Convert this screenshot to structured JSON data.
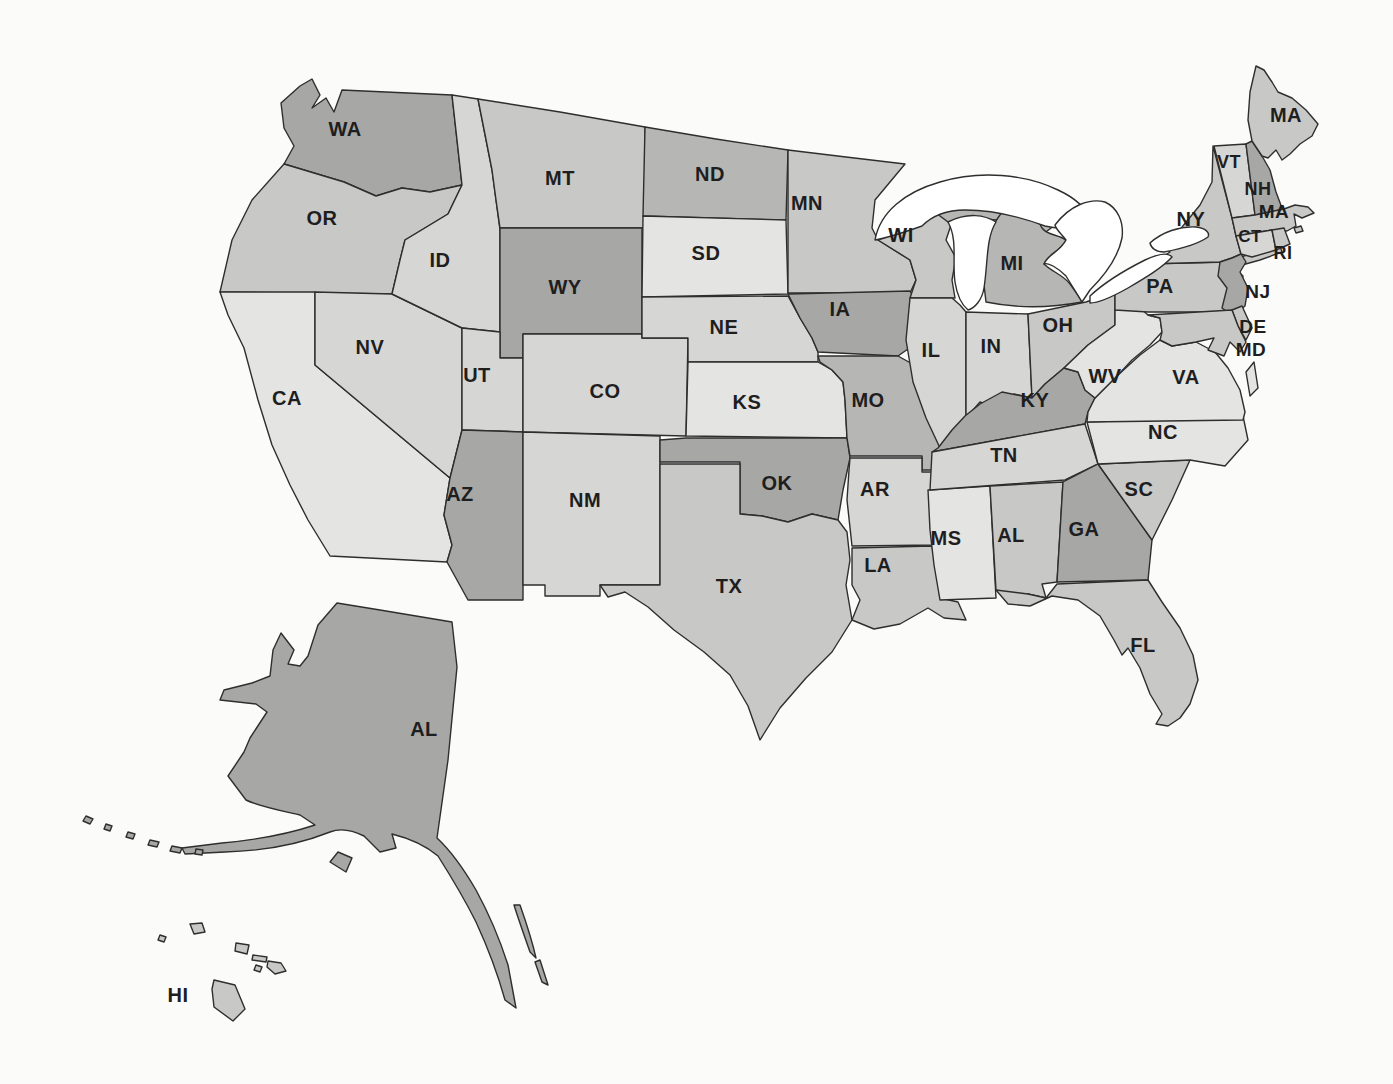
{
  "figure": {
    "kind": "us-states-map",
    "background": "#fbfbfa",
    "border_color": "#2e2e2e",
    "label_color": "#1e1e1e"
  },
  "palette": {
    "s1": "#e4e4e3",
    "s2": "#d6d6d5",
    "s3": "#c8c8c7",
    "s4": "#b6b6b5",
    "s5": "#a7a7a6",
    "water": "#ffffff"
  },
  "states": [
    {
      "id": "WA",
      "label": "WA",
      "shade": "s5"
    },
    {
      "id": "OR",
      "label": "OR",
      "shade": "s3"
    },
    {
      "id": "CA",
      "label": "CA",
      "shade": "s1"
    },
    {
      "id": "NV",
      "label": "NV",
      "shade": "s2"
    },
    {
      "id": "ID",
      "label": "ID",
      "shade": "s2"
    },
    {
      "id": "MT",
      "label": "MT",
      "shade": "s3"
    },
    {
      "id": "WY",
      "label": "WY",
      "shade": "s5"
    },
    {
      "id": "UT",
      "label": "UT",
      "shade": "s2"
    },
    {
      "id": "CO",
      "label": "CO",
      "shade": "s2"
    },
    {
      "id": "AZ",
      "label": "AZ",
      "shade": "s5"
    },
    {
      "id": "NM",
      "label": "NM",
      "shade": "s2"
    },
    {
      "id": "ND",
      "label": "ND",
      "shade": "s4"
    },
    {
      "id": "SD",
      "label": "SD",
      "shade": "s1"
    },
    {
      "id": "NE",
      "label": "NE",
      "shade": "s2"
    },
    {
      "id": "KS",
      "label": "KS",
      "shade": "s1"
    },
    {
      "id": "OK",
      "label": "OK",
      "shade": "s5"
    },
    {
      "id": "TX",
      "label": "TX",
      "shade": "s3"
    },
    {
      "id": "MN",
      "label": "MN",
      "shade": "s3"
    },
    {
      "id": "IA",
      "label": "IA",
      "shade": "s5"
    },
    {
      "id": "MO",
      "label": "MO",
      "shade": "s4"
    },
    {
      "id": "AR",
      "label": "AR",
      "shade": "s2"
    },
    {
      "id": "LA",
      "label": "LA",
      "shade": "s3"
    },
    {
      "id": "MS",
      "label": "MS",
      "shade": "s1"
    },
    {
      "id": "WI",
      "label": "WI",
      "shade": "s3"
    },
    {
      "id": "IL",
      "label": "IL",
      "shade": "s2"
    },
    {
      "id": "IN",
      "label": "IN",
      "shade": "s2"
    },
    {
      "id": "OH",
      "label": "OH",
      "shade": "s3"
    },
    {
      "id": "MI",
      "label": "MI",
      "shade": "s4"
    },
    {
      "id": "KY",
      "label": "KY",
      "shade": "s5"
    },
    {
      "id": "TN",
      "label": "TN",
      "shade": "s2"
    },
    {
      "id": "AL",
      "label": "AL",
      "shade": "s3"
    },
    {
      "id": "GA",
      "label": "GA",
      "shade": "s5"
    },
    {
      "id": "FL",
      "label": "FL",
      "shade": "s3"
    },
    {
      "id": "SC",
      "label": "SC",
      "shade": "s3"
    },
    {
      "id": "NC",
      "label": "NC",
      "shade": "s1"
    },
    {
      "id": "VA",
      "label": "VA",
      "shade": "s1"
    },
    {
      "id": "WV",
      "label": "WV",
      "shade": "s1"
    },
    {
      "id": "PA",
      "label": "PA",
      "shade": "s3"
    },
    {
      "id": "NY",
      "label": "NY",
      "shade": "s3"
    },
    {
      "id": "NJ",
      "label": "NJ",
      "shade": "s5"
    },
    {
      "id": "DE",
      "label": "DE",
      "shade": "s3"
    },
    {
      "id": "MD",
      "label": "MD",
      "shade": "s3"
    },
    {
      "id": "VT",
      "label": "VT",
      "shade": "s2"
    },
    {
      "id": "NH",
      "label": "NH",
      "shade": "s5"
    },
    {
      "id": "MA",
      "label": "MA",
      "shade": "s3"
    },
    {
      "id": "CT",
      "label": "CT",
      "shade": "s2"
    },
    {
      "id": "RI",
      "label": "RI",
      "shade": "s3"
    },
    {
      "id": "ME",
      "label": "MA",
      "shade": "s3"
    },
    {
      "id": "AK",
      "label": "AL",
      "shade": "s5"
    },
    {
      "id": "HI",
      "label": "HI",
      "shade": "s3"
    }
  ]
}
